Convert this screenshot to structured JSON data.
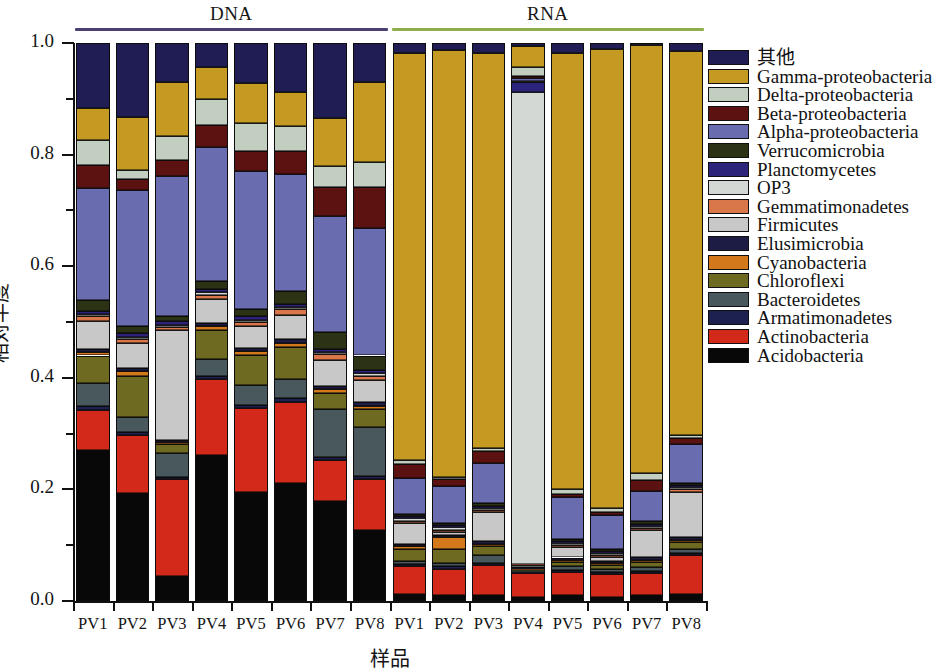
{
  "chart_data": {
    "type": "bar",
    "subtype": "stacked-bar-100pct",
    "title": "",
    "xlabel": "样品",
    "ylabel": "相对丰度",
    "ylim": [
      0.0,
      1.0
    ],
    "ytick_labels": [
      "0.0",
      "0.2",
      "0.4",
      "0.6",
      "0.8",
      "1.0"
    ],
    "ytick_values": [
      0.0,
      0.2,
      0.4,
      0.6,
      0.8,
      1.0
    ],
    "yminor_values": [
      0.1,
      0.3,
      0.5,
      0.7,
      0.9
    ],
    "grid": false,
    "legend_position": "right",
    "groups": [
      {
        "name": "DNA",
        "rule_color": "#4c3f72",
        "span": [
          0,
          7
        ]
      },
      {
        "name": "RNA",
        "rule_color": "#8fae4b",
        "span": [
          8,
          15
        ]
      }
    ],
    "categories": [
      "PV1",
      "PV2",
      "PV3",
      "PV4",
      "PV5",
      "PV6",
      "PV7",
      "PV8",
      "PV1",
      "PV2",
      "PV3",
      "PV4",
      "PV5",
      "PV6",
      "PV7",
      "PV8"
    ],
    "legend_order_top_to_bottom": [
      "其他",
      "Gamma-proteobacteria",
      "Delta-proteobacteria",
      "Beta-proteobacteria",
      "Alpha-proteobacteria",
      "Verrucomicrobia",
      "Planctomycetes",
      "OP3",
      "Gemmatimonadetes",
      "Firmicutes",
      "Elusimicrobia",
      "Cyanobacteria",
      "Chloroflexi",
      "Bacteroidetes",
      "Armatimonadetes",
      "Actinobacteria",
      "Acidobacteria"
    ],
    "colors": {
      "其他": "#201d55",
      "Gamma-proteobacteria": "#c49a22",
      "Delta-proteobacteria": "#c2cfc0",
      "Beta-proteobacteria": "#5d1212",
      "Alpha-proteobacteria": "#6a6cb0",
      "Verrucomicrobia": "#2b3314",
      "Planctomycetes": "#2b247a",
      "OP3": "#d3d8d4",
      "Gemmatimonadetes": "#d9764a",
      "Firmicutes": "#c8c8c8",
      "Elusimicrobia": "#1c1c44",
      "Cyanobacteria": "#d4781c",
      "Chloroflexi": "#6e6a22",
      "Bacteroidetes": "#49585c",
      "Armatimonadetes": "#1d2150",
      "Actinobacteria": "#d3291b",
      "Acidobacteria": "#080808"
    },
    "stack_order_bottom_to_top": [
      "Acidobacteria",
      "Actinobacteria",
      "Armatimonadetes",
      "Bacteroidetes",
      "Chloroflexi",
      "Cyanobacteria",
      "Elusimicrobia",
      "Firmicutes",
      "Gemmatimonadetes",
      "OP3",
      "Planctomycetes",
      "Verrucomicrobia",
      "Alpha-proteobacteria",
      "Beta-proteobacteria",
      "Delta-proteobacteria",
      "Gamma-proteobacteria",
      "其他"
    ],
    "series": [
      {
        "name": "Acidobacteria",
        "values": [
          0.27,
          0.193,
          0.045,
          0.262,
          0.196,
          0.212,
          0.18,
          0.128,
          0.012,
          0.01,
          0.01,
          0.008,
          0.01,
          0.008,
          0.01,
          0.012
        ]
      },
      {
        "name": "Actinobacteria",
        "values": [
          0.072,
          0.104,
          0.173,
          0.135,
          0.15,
          0.145,
          0.072,
          0.09,
          0.05,
          0.048,
          0.055,
          0.044,
          0.042,
          0.04,
          0.04,
          0.07
        ]
      },
      {
        "name": "Armatimonadetes",
        "values": [
          0.008,
          0.006,
          0.005,
          0.006,
          0.006,
          0.006,
          0.006,
          0.006,
          0.004,
          0.004,
          0.004,
          0.002,
          0.004,
          0.004,
          0.004,
          0.004
        ]
      },
      {
        "name": "Bacteroidetes",
        "values": [
          0.04,
          0.026,
          0.042,
          0.03,
          0.036,
          0.034,
          0.086,
          0.088,
          0.006,
          0.006,
          0.014,
          0.002,
          0.006,
          0.006,
          0.006,
          0.008
        ]
      },
      {
        "name": "Chloroflexi",
        "values": [
          0.05,
          0.075,
          0.016,
          0.052,
          0.052,
          0.058,
          0.028,
          0.032,
          0.022,
          0.026,
          0.016,
          0.002,
          0.008,
          0.006,
          0.01,
          0.012
        ]
      },
      {
        "name": "Cyanobacteria",
        "values": [
          0.006,
          0.008,
          0.004,
          0.008,
          0.008,
          0.008,
          0.008,
          0.006,
          0.004,
          0.02,
          0.004,
          0.002,
          0.004,
          0.004,
          0.004,
          0.004
        ]
      },
      {
        "name": "Elusimicrobia",
        "values": [
          0.006,
          0.006,
          0.004,
          0.006,
          0.006,
          0.006,
          0.006,
          0.006,
          0.004,
          0.004,
          0.004,
          0.002,
          0.004,
          0.004,
          0.004,
          0.004
        ]
      },
      {
        "name": "Firmicutes",
        "values": [
          0.05,
          0.044,
          0.196,
          0.042,
          0.038,
          0.044,
          0.046,
          0.04,
          0.038,
          0.006,
          0.052,
          0.004,
          0.018,
          0.006,
          0.048,
          0.082
        ]
      },
      {
        "name": "Gemmatimonadetes",
        "values": [
          0.008,
          0.008,
          0.006,
          0.008,
          0.008,
          0.01,
          0.01,
          0.008,
          0.004,
          0.004,
          0.004,
          0.002,
          0.004,
          0.004,
          0.004,
          0.004
        ]
      },
      {
        "name": "OP3",
        "values": [
          0.004,
          0.004,
          0.004,
          0.004,
          0.004,
          0.004,
          0.004,
          0.004,
          0.004,
          0.004,
          0.004,
          0.872,
          0.004,
          0.004,
          0.004,
          0.004
        ]
      },
      {
        "name": "Planctomycetes",
        "values": [
          0.006,
          0.006,
          0.006,
          0.006,
          0.006,
          0.006,
          0.006,
          0.006,
          0.004,
          0.004,
          0.004,
          0.018,
          0.004,
          0.004,
          0.004,
          0.004
        ]
      },
      {
        "name": "Verrucomicrobia",
        "values": [
          0.02,
          0.012,
          0.01,
          0.014,
          0.014,
          0.022,
          0.03,
          0.026,
          0.004,
          0.004,
          0.004,
          0.002,
          0.004,
          0.004,
          0.004,
          0.004
        ]
      },
      {
        "name": "Alpha-proteobacteria",
        "values": [
          0.2,
          0.244,
          0.25,
          0.24,
          0.246,
          0.21,
          0.208,
          0.228,
          0.064,
          0.066,
          0.072,
          0.006,
          0.074,
          0.06,
          0.054,
          0.07
        ]
      },
      {
        "name": "Beta-proteobacteria",
        "values": [
          0.042,
          0.02,
          0.03,
          0.04,
          0.036,
          0.042,
          0.052,
          0.074,
          0.026,
          0.012,
          0.022,
          0.004,
          0.006,
          0.006,
          0.02,
          0.01
        ]
      },
      {
        "name": "Delta-proteobacteria",
        "values": [
          0.044,
          0.016,
          0.042,
          0.046,
          0.05,
          0.044,
          0.038,
          0.044,
          0.006,
          0.004,
          0.006,
          0.016,
          0.008,
          0.006,
          0.012,
          0.006
        ]
      },
      {
        "name": "Gamma-proteobacteria",
        "values": [
          0.058,
          0.096,
          0.098,
          0.058,
          0.072,
          0.062,
          0.086,
          0.144,
          0.73,
          0.766,
          0.707,
          0.038,
          0.782,
          0.824,
          0.764,
          0.688
        ]
      },
      {
        "name": "其他",
        "values": [
          0.116,
          0.132,
          0.069,
          0.043,
          0.072,
          0.087,
          0.134,
          0.07,
          0.018,
          0.012,
          0.018,
          0.006,
          0.018,
          0.01,
          0.004,
          0.014
        ]
      }
    ]
  },
  "axes": {
    "y_title": "相对丰度",
    "x_title": "样品"
  }
}
